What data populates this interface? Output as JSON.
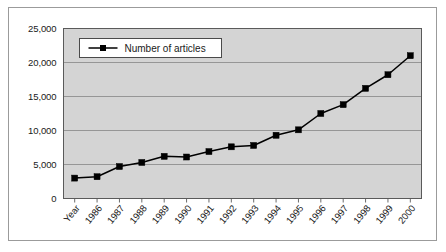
{
  "figure": {
    "background_color": "#ffffff",
    "frame_color": "#9b9b9b"
  },
  "chart_data": {
    "type": "line",
    "title": "",
    "subtitle": "",
    "xlabel": "",
    "ylabel": "",
    "categories": [
      "Year",
      "1986",
      "1987",
      "1988",
      "1989",
      "1990",
      "1991",
      "1992",
      "1993",
      "1994",
      "1995",
      "1996",
      "1997",
      "1998",
      "1999",
      "2000"
    ],
    "series": [
      {
        "name": "Number of articles",
        "values": [
          3000,
          3200,
          4700,
          5300,
          6200,
          6100,
          6900,
          7600,
          7800,
          9300,
          10100,
          12500,
          13800,
          16200,
          18200,
          21000
        ],
        "color": "#000000",
        "marker": "square"
      }
    ],
    "ylim": [
      0,
      25000
    ],
    "ytick_values": [
      0,
      5000,
      10000,
      15000,
      20000,
      25000
    ],
    "ytick_labels": [
      "0",
      "5,000",
      "10,000",
      "15,000",
      "20,000",
      "25,000"
    ],
    "grid": true,
    "grid_axis": "y",
    "legend_position": "upper-left",
    "plot_background": "#d4d4d4",
    "grid_color": "#8e8e8e"
  },
  "legend": {
    "entries": [
      {
        "label": "Number of articles",
        "color": "#000000"
      }
    ]
  }
}
